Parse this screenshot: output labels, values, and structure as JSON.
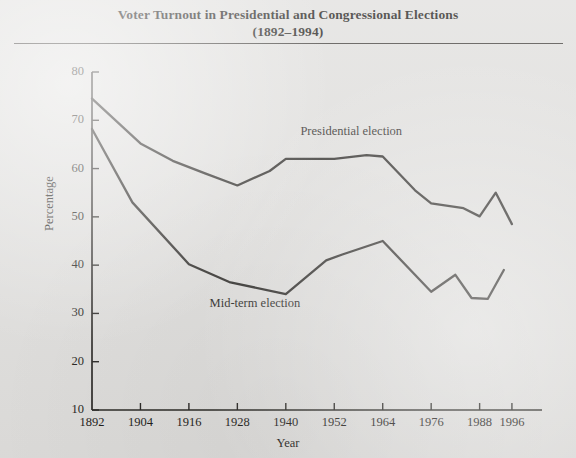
{
  "figure": {
    "title_line1": "Voter Turnout in Presidential and Congressional Elections",
    "title_line2": "(1892–1994)",
    "background_color": "#dedddb",
    "ink_color": "#262421"
  },
  "chart_data": {
    "type": "line",
    "title": "Voter Turnout in Presidential and Congressional Elections (1892–1994)",
    "xlabel": "Year",
    "ylabel": "Percentage",
    "xlim": [
      1892,
      1998
    ],
    "ylim": [
      10,
      80
    ],
    "xticks": [
      1892,
      1904,
      1916,
      1928,
      1940,
      1952,
      1964,
      1976,
      1988,
      1996
    ],
    "xtick_labels": [
      "1892",
      "1904",
      "1916",
      "1928",
      "1940",
      "1952",
      "1964",
      "1976",
      "1988",
      "1996"
    ],
    "yticks": [
      10,
      20,
      30,
      40,
      50,
      60,
      70,
      80
    ],
    "ytick_labels": [
      "10",
      "20",
      "30",
      "40",
      "50",
      "60",
      "70",
      "80"
    ],
    "grid": false,
    "legend": "inline-labels",
    "series": [
      {
        "name": "Presidential election",
        "label_position": {
          "x": 1956,
          "y": 67.5
        },
        "points": [
          {
            "x": 1892,
            "y": 74.5
          },
          {
            "x": 1904,
            "y": 65.2
          },
          {
            "x": 1912,
            "y": 61.6
          },
          {
            "x": 1920,
            "y": 59.0
          },
          {
            "x": 1928,
            "y": 56.5
          },
          {
            "x": 1936,
            "y": 59.5
          },
          {
            "x": 1940,
            "y": 62.0
          },
          {
            "x": 1952,
            "y": 62.0
          },
          {
            "x": 1960,
            "y": 62.8
          },
          {
            "x": 1964,
            "y": 62.5
          },
          {
            "x": 1972,
            "y": 55.5
          },
          {
            "x": 1976,
            "y": 52.8
          },
          {
            "x": 1984,
            "y": 51.8
          },
          {
            "x": 1988,
            "y": 50.1
          },
          {
            "x": 1992,
            "y": 55.0
          },
          {
            "x": 1996,
            "y": 48.5
          }
        ]
      },
      {
        "name": "Mid-term election",
        "label_position": {
          "x": 1934,
          "y": 32.0
        },
        "points": [
          {
            "x": 1892,
            "y": 68.2
          },
          {
            "x": 1902,
            "y": 53.0
          },
          {
            "x": 1916,
            "y": 40.2
          },
          {
            "x": 1926,
            "y": 36.5
          },
          {
            "x": 1940,
            "y": 34.0
          },
          {
            "x": 1950,
            "y": 41.0
          },
          {
            "x": 1954,
            "y": 42.2
          },
          {
            "x": 1964,
            "y": 45.0
          },
          {
            "x": 1976,
            "y": 34.5
          },
          {
            "x": 1982,
            "y": 38.0
          },
          {
            "x": 1986,
            "y": 33.2
          },
          {
            "x": 1990,
            "y": 33.0
          },
          {
            "x": 1994,
            "y": 39.0
          }
        ]
      }
    ]
  },
  "axes": {
    "y_title": "Percentage",
    "x_title": "Year"
  }
}
